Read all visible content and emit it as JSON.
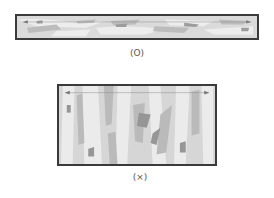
{
  "figure": {
    "panels": [
      {
        "id": "parallel",
        "caption": "(O)",
        "orientation": "strands parallel to long axis",
        "colors": {
          "border": "#3a3a3a",
          "base": "#d9d9d9",
          "light": "#ececec",
          "mid": "#bdbdbd",
          "dark": "#9a9a9a"
        }
      },
      {
        "id": "perpendicular",
        "caption": "(×)",
        "orientation": "strands perpendicular to long axis",
        "colors": {
          "border": "#3a3a3a",
          "base": "#d5d5d5",
          "light": "#eaeaea",
          "mid": "#b8b8b8",
          "dark": "#949494"
        }
      }
    ]
  }
}
